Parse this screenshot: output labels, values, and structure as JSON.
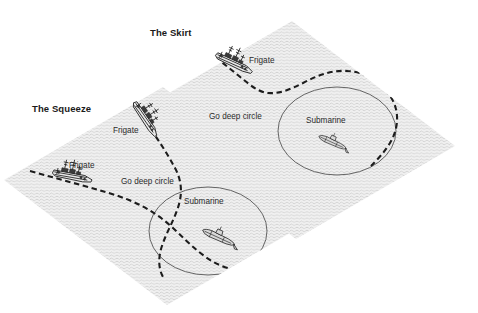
{
  "figure": {
    "background_color": "#ffffff",
    "sea_fill_color": "#e9e9e9",
    "path_color": "#1c1c1c",
    "circle_color": "#555555",
    "title_color": "#1a1a1a",
    "label_color": "#2b2b2b"
  },
  "panels": [
    {
      "id": "skirt",
      "title": "The Skirt",
      "labels": {
        "frigate": "Frigate",
        "go_deep_circle": "Go deep circle",
        "submarine": "Submarine"
      }
    },
    {
      "id": "squeeze",
      "title": "The Squeeze",
      "labels": {
        "frigate_upper": "Frigate",
        "frigate_lower": "Frigate",
        "go_deep_circle": "Go deep circle",
        "submarine": "Submarine"
      }
    }
  ]
}
